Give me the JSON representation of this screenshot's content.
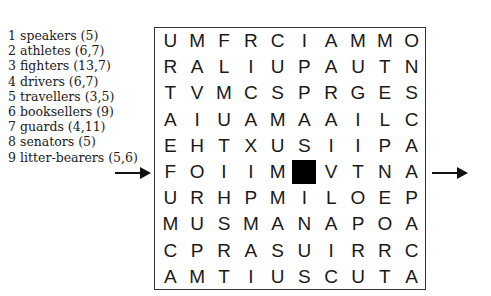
{
  "clues": [
    {
      "num": "1",
      "text": "speakers (5)"
    },
    {
      "num": "2",
      "text": "athletes (6,7)"
    },
    {
      "num": "3",
      "text": "fighters (13,7)"
    },
    {
      "num": "4",
      "text": "drivers (6,7)"
    },
    {
      "num": "5",
      "text": "travellers (3,5)"
    },
    {
      "num": "6",
      "text": "booksellers (9)"
    },
    {
      "num": "7",
      "text": "guards (4,11)"
    },
    {
      "num": "8",
      "text": "senators (5)"
    },
    {
      "num": "9",
      "text": "litter-bearers (5,6)"
    }
  ],
  "grid": {
    "rows": [
      [
        "U",
        "M",
        "F",
        "R",
        "C",
        "I",
        "A",
        "M",
        "M",
        "O"
      ],
      [
        "R",
        "A",
        "L",
        "I",
        "U",
        "P",
        "A",
        "U",
        "T",
        "N"
      ],
      [
        "T",
        "V",
        "M",
        "C",
        "S",
        "P",
        "R",
        "G",
        "E",
        "S"
      ],
      [
        "A",
        "I",
        "U",
        "A",
        "M",
        "A",
        "A",
        "I",
        "L",
        "C"
      ],
      [
        "E",
        "H",
        "T",
        "X",
        "U",
        "S",
        "I",
        "I",
        "P",
        "A"
      ],
      [
        "F",
        "O",
        "I",
        "I",
        "M",
        "#",
        "V",
        "T",
        "N",
        "A"
      ],
      [
        "U",
        "R",
        "H",
        "P",
        "M",
        "I",
        "L",
        "O",
        "E",
        "P"
      ],
      [
        "M",
        "U",
        "S",
        "M",
        "A",
        "N",
        "A",
        "P",
        "O",
        "A"
      ],
      [
        "C",
        "P",
        "R",
        "A",
        "S",
        "U",
        "I",
        "R",
        "R",
        "C"
      ],
      [
        "A",
        "M",
        "T",
        "I",
        "U",
        "S",
        "C",
        "U",
        "T",
        "A"
      ]
    ],
    "black_cell": {
      "row": 6,
      "col": 6
    }
  },
  "arrows": {
    "entry_row": 6,
    "exit_row": 6
  }
}
